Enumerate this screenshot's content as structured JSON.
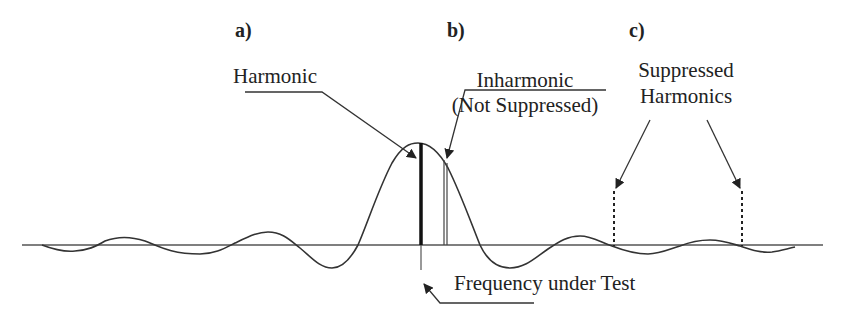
{
  "diagram": {
    "panel_labels": {
      "a": "a)",
      "b": "b)",
      "c": "c)"
    },
    "annotations": {
      "harmonic": "Harmonic",
      "inharmonic_line1": "Inharmonic",
      "inharmonic_line2": "(Not Suppressed)",
      "suppressed_line1": "Suppressed",
      "suppressed_line2": "Harmonics",
      "frequency_under_test": "Frequency under Test"
    },
    "elements": {
      "baseline": "horizontal frequency axis",
      "response_curve": "sinc-like filter response centered on frequency under test",
      "harmonic_line": "solid thick vertical line at peak",
      "inharmonic_line": "thin double vertical line offset from peak",
      "suppressed_harmonic_lines": "two dotted vertical lines at response zero crossings",
      "test_frequency_marker": "thin vertical line below axis at center frequency"
    },
    "colors": {
      "ink": "#222222",
      "axis": "#555555",
      "background": "#ffffff"
    }
  }
}
